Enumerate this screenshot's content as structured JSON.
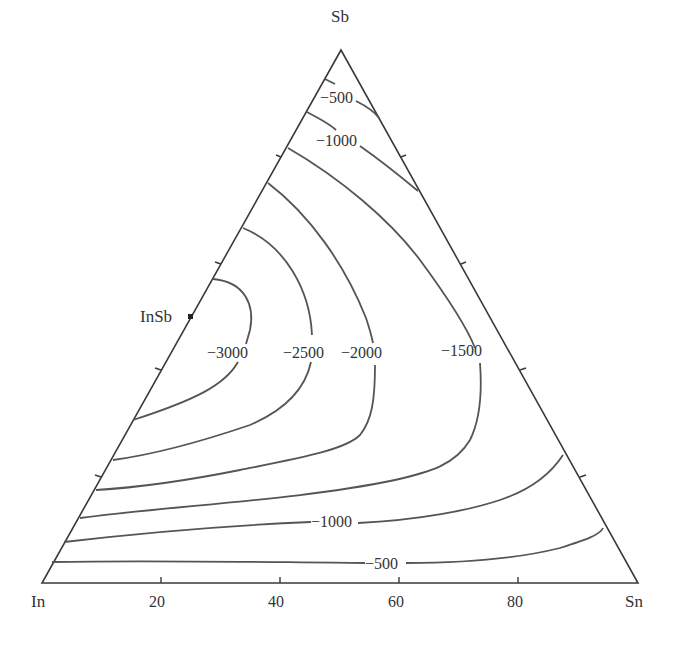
{
  "diagram": {
    "type": "ternary-isoline",
    "vertices": {
      "top": "Sb",
      "left": "In",
      "right": "Sn"
    },
    "compound_marker": "InSb",
    "bottom_axis_ticks": [
      "20",
      "40",
      "60",
      "80"
    ],
    "contour_labels": {
      "c500_top": "−500",
      "c1000_top": "−1000",
      "c3000": "−3000",
      "c2500": "−2500",
      "c2000": "−2000",
      "c1500": "−1500",
      "c1000_bottom": "−1000",
      "c500_bottom": "−500"
    },
    "contour_levels": [
      -500,
      -1000,
      -1500,
      -2000,
      -2500,
      -3000
    ],
    "colors": {
      "edge": "#3a3a3a",
      "isoline": "#555555",
      "text": "#333333"
    }
  }
}
